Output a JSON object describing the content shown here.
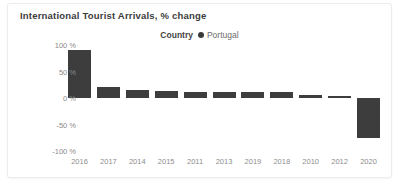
{
  "card": {
    "title": "International Tourist Arrivals, % change"
  },
  "legend": {
    "title": "Country",
    "entries": [
      {
        "label": "Portugal",
        "color": "#3a3a3a",
        "marker": "circle-dot-icon"
      }
    ]
  },
  "chart_data": {
    "type": "bar",
    "title": "International Tourist Arrivals, % change",
    "xlabel": "",
    "ylabel": "",
    "ylim": [
      -100,
      100
    ],
    "ytick_labels": [
      "100 %",
      "50 %",
      "0 %",
      "-50 %",
      "-100 %"
    ],
    "yticks": [
      100,
      50,
      0,
      -50,
      -100
    ],
    "grid": false,
    "legend_position": "top-center",
    "series_name": "Portugal",
    "bar_color": "#3d3d3d",
    "categories": [
      "2016",
      "2017",
      "2014",
      "2015",
      "2011",
      "2013",
      "2019",
      "2018",
      "2010",
      "2012",
      "2020"
    ],
    "values": [
      90,
      21,
      15,
      13,
      12,
      12,
      11,
      11,
      6,
      3,
      -75
    ]
  },
  "axis": {
    "y_ticks": [
      {
        "label": "100 %",
        "value": 100
      },
      {
        "label": "50 %",
        "value": 50
      },
      {
        "label": "0 %",
        "value": 0
      },
      {
        "label": "-50 %",
        "value": -50
      },
      {
        "label": "-100 %",
        "value": -100
      }
    ]
  }
}
